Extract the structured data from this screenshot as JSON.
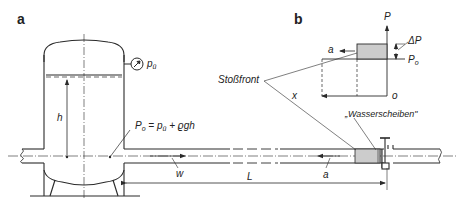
{
  "panels": {
    "a": "a",
    "b": "b"
  },
  "labels": {
    "gauge_pressure": "p",
    "gauge_pressure_sub": "ü",
    "height": "h",
    "static_pressure_eq_P": "P",
    "static_pressure_eq_P_sub": "o",
    "static_pressure_eq_rest": " = p",
    "static_pressure_eq_rest_sub": "ü",
    "static_pressure_eq_tail": " + ϱgh",
    "velocity": "w",
    "length": "L",
    "wave_speed_pipe": "a",
    "shock_front": "Stoßfront",
    "water_disks": "„Wasserscheiben\"",
    "axis_P": "P",
    "delta_P": "ΔP",
    "P0": "P",
    "P0_sub": "o",
    "axis_x": "x",
    "origin": "o",
    "wave_speed_graph": "a"
  },
  "colors": {
    "line": "#2a2a2a",
    "shade": "#cccccc",
    "background": "#ffffff"
  }
}
